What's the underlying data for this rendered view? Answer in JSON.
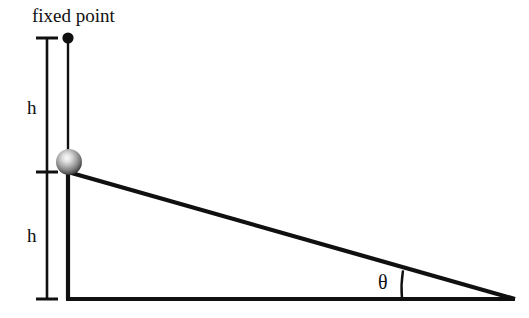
{
  "figure": {
    "background_color": "#ffffff",
    "stroke_color": "#101010",
    "width": 529,
    "height": 318
  },
  "labels": {
    "fixed_point": "fixed point",
    "h_upper": "h",
    "h_lower": "h",
    "theta": "θ"
  },
  "geometry": {
    "fixed_point": {
      "x": 68,
      "y": 38,
      "radius": 5.5
    },
    "bob": {
      "x": 69,
      "y": 162,
      "radius": 13
    },
    "string": {
      "x1": 68,
      "y1": 38,
      "x2": 68,
      "y2": 160
    },
    "triangle": {
      "apex": {
        "x": 68,
        "y": 172
      },
      "corner": {
        "x": 68,
        "y": 299
      },
      "right_vertex": {
        "x": 514,
        "y": 299
      }
    },
    "measure_bar": {
      "x": 47,
      "tick_top_y": 38,
      "tick_mid_y": 172,
      "tick_bottom_y": 299,
      "tick_half_width": 11
    },
    "angle_arc": {
      "vertex_x": 514,
      "vertex_y": 299,
      "radius": 112,
      "start_y": 272,
      "end_y": 299
    }
  },
  "colors": {
    "line": "#101010",
    "bob_highlight": "#f2f2f2",
    "bob_mid": "#9a9a9a",
    "bob_edge": "#2b2b2b",
    "text": "#101010"
  }
}
